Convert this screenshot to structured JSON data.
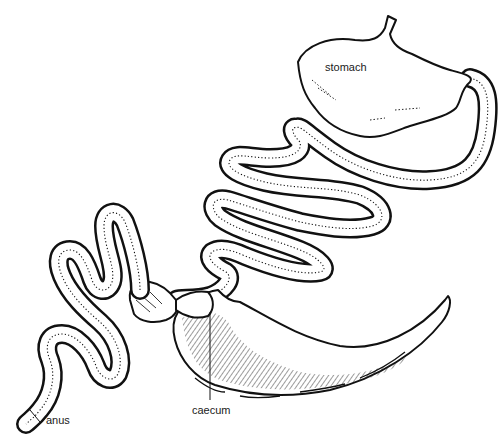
{
  "figure": {
    "labels": {
      "stomach": "stomach",
      "caecum": "caecum",
      "anus": "anus"
    },
    "colors": {
      "ink": "#111111",
      "background": "#ffffff"
    }
  }
}
